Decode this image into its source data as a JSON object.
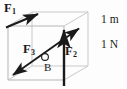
{
  "figure": {
    "kind": "physics-force-diagram",
    "colors": {
      "background": "#fdfdfd",
      "cube_edge": "#c9c9c9",
      "cube_edge_dark": "#a8a8a8",
      "vector": "#1a1a1a",
      "text": "#1a1a1a"
    },
    "labels": {
      "f1": "F",
      "f1_sub": "1",
      "f2": "F",
      "f2_sub": "2",
      "f3": "F",
      "f3_sub": "3",
      "point_b": "B",
      "scale_length": "1 m",
      "scale_force": "1 N"
    },
    "vectors": [
      {
        "name": "F1",
        "label": "F₁",
        "heads": 1,
        "from": [
          8,
          26
        ],
        "to": [
          40,
          13
        ],
        "direction": "up-right along top-left cube edge"
      },
      {
        "name": "F2",
        "label": "F₂",
        "heads": 1,
        "from": [
          64,
          86
        ],
        "to": [
          64,
          28
        ],
        "direction": "vertically upward"
      },
      {
        "name": "F3",
        "label": "F₃",
        "heads": 2,
        "from": [
          12,
          76
        ],
        "to": [
          80,
          28
        ],
        "direction": "double-headed diagonal, lower-left to upper-right"
      }
    ],
    "point": {
      "name": "B",
      "label": "B",
      "at": [
        44,
        57
      ],
      "marker": "open-circle"
    },
    "cube": {
      "front_face": [
        [
          8,
          26
        ],
        [
          64,
          26
        ],
        [
          64,
          80
        ],
        [
          8,
          80
        ]
      ],
      "depth_offset": [
        24,
        -14
      ]
    }
  }
}
